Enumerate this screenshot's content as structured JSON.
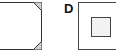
{
  "figures": [
    {
      "id": "C",
      "label": "",
      "description": "square with cut corners",
      "visible_label": false
    },
    {
      "id": "D",
      "label": "D",
      "description": "square containing smaller shaded square"
    }
  ],
  "colors": {
    "stroke": "#333333",
    "inner_fill": "#f2f2f2"
  }
}
